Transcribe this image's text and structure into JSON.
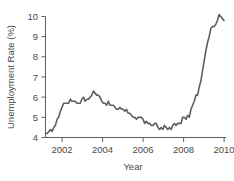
{
  "chart_data": {
    "type": "line",
    "title": "",
    "subtitle": "",
    "xlabel": "Year",
    "ylabel": "Unemployment Rate (%)",
    "xlim": [
      2001.0,
      2010.1
    ],
    "ylim": [
      4,
      10
    ],
    "xticks": [
      2002,
      2004,
      2006,
      2008,
      2010
    ],
    "xtick_labels": [
      "2002",
      "2004",
      "2006",
      "2008",
      "2010"
    ],
    "yticks": [
      4,
      5,
      6,
      7,
      8,
      9,
      10
    ],
    "ytick_labels": [
      "4",
      "5",
      "6",
      "7",
      "8",
      "9",
      "10"
    ],
    "grid": false,
    "legend": null,
    "legend_position": "none",
    "annotations": [],
    "line_color": "#5e5e5e",
    "line_width": 1.6,
    "series": [
      {
        "name": "Unemployment Rate",
        "x": [
          2001.0,
          2001.083,
          2001.167,
          2001.25,
          2001.333,
          2001.417,
          2001.5,
          2001.583,
          2001.667,
          2001.75,
          2001.833,
          2001.917,
          2002.0,
          2002.083,
          2002.167,
          2002.25,
          2002.333,
          2002.417,
          2002.5,
          2002.583,
          2002.667,
          2002.75,
          2002.833,
          2002.917,
          2003.0,
          2003.083,
          2003.167,
          2003.25,
          2003.333,
          2003.417,
          2003.5,
          2003.583,
          2003.667,
          2003.75,
          2003.833,
          2003.917,
          2004.0,
          2004.083,
          2004.167,
          2004.25,
          2004.333,
          2004.417,
          2004.5,
          2004.583,
          2004.667,
          2004.75,
          2004.833,
          2004.917,
          2005.0,
          2005.083,
          2005.167,
          2005.25,
          2005.333,
          2005.417,
          2005.5,
          2005.583,
          2005.667,
          2005.75,
          2005.833,
          2005.917,
          2006.0,
          2006.083,
          2006.167,
          2006.25,
          2006.333,
          2006.417,
          2006.5,
          2006.583,
          2006.667,
          2006.75,
          2006.833,
          2006.917,
          2007.0,
          2007.083,
          2007.167,
          2007.25,
          2007.333,
          2007.417,
          2007.5,
          2007.583,
          2007.667,
          2007.75,
          2007.833,
          2007.917,
          2008.0,
          2008.083,
          2008.167,
          2008.25,
          2008.333,
          2008.417,
          2008.5,
          2008.583,
          2008.667,
          2008.75,
          2008.833,
          2008.917,
          2009.0,
          2009.083,
          2009.167,
          2009.25,
          2009.333,
          2009.417,
          2009.5,
          2009.583,
          2009.667,
          2009.75,
          2009.833,
          2009.917,
          2010.0
        ],
        "values": [
          4.2,
          4.2,
          4.3,
          4.4,
          4.3,
          4.5,
          4.6,
          4.9,
          5.0,
          5.3,
          5.5,
          5.7,
          5.7,
          5.7,
          5.7,
          5.9,
          5.8,
          5.8,
          5.8,
          5.7,
          5.7,
          5.7,
          5.9,
          6.0,
          5.8,
          5.9,
          5.9,
          6.0,
          6.1,
          6.3,
          6.2,
          6.1,
          6.1,
          6.0,
          5.8,
          5.7,
          5.7,
          5.6,
          5.8,
          5.6,
          5.6,
          5.6,
          5.5,
          5.4,
          5.4,
          5.5,
          5.4,
          5.4,
          5.3,
          5.4,
          5.2,
          5.2,
          5.1,
          5.0,
          5.0,
          4.9,
          5.0,
          5.0,
          5.0,
          4.9,
          4.7,
          4.8,
          4.7,
          4.7,
          4.6,
          4.6,
          4.7,
          4.7,
          4.5,
          4.4,
          4.5,
          4.4,
          4.6,
          4.5,
          4.4,
          4.5,
          4.4,
          4.6,
          4.7,
          4.6,
          4.7,
          4.7,
          4.7,
          5.0,
          5.0,
          4.9,
          5.1,
          5.0,
          5.4,
          5.6,
          5.8,
          6.1,
          6.1,
          6.5,
          6.8,
          7.3,
          7.8,
          8.3,
          8.7,
          9.0,
          9.4,
          9.5,
          9.5,
          9.6,
          9.8,
          10.1,
          10.0,
          9.9,
          9.8
        ]
      }
    ]
  },
  "figure": {
    "ylabel": "Unemployment Rate (%)",
    "xlabel": "Year"
  }
}
